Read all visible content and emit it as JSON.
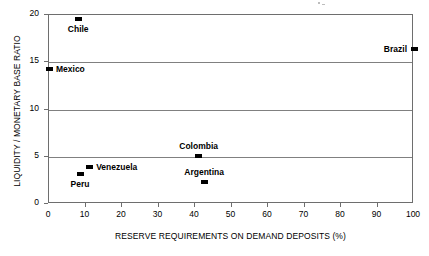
{
  "chart_data": {
    "type": "scatter",
    "title": "",
    "xlabel": "RESERVE REQUIREMENTS ON DEMAND DEPOSITS (%)",
    "ylabel": "LIQUIDITY / MONETARY BASE RATIO",
    "xlim": [
      0,
      100
    ],
    "ylim": [
      0,
      20
    ],
    "xticks": [
      0,
      10,
      20,
      30,
      40,
      50,
      60,
      70,
      80,
      90,
      100
    ],
    "yticks": [
      0,
      5,
      10,
      15,
      20
    ],
    "xtick_labels": [
      "0",
      "10",
      "20",
      "30",
      "40",
      "50",
      "60",
      "70",
      "80",
      "90",
      "100"
    ],
    "ytick_labels": [
      "0",
      "5",
      "10",
      "15",
      "20"
    ],
    "grid": "horizontal",
    "legend": "none",
    "marker": "filled-rectangle",
    "marker_color": "#000000",
    "points": [
      {
        "name": "Chile",
        "x": 8,
        "y": 19.6,
        "label_pos": "below"
      },
      {
        "name": "Mexico",
        "x": 0,
        "y": 14.3,
        "label_pos": "right"
      },
      {
        "name": "Brazil",
        "x": 100,
        "y": 16.4,
        "label_pos": "left"
      },
      {
        "name": "Colombia",
        "x": 41,
        "y": 5.1,
        "label_pos": "above"
      },
      {
        "name": "Venezuela",
        "x": 11,
        "y": 3.9,
        "label_pos": "right"
      },
      {
        "name": "Peru",
        "x": 8.5,
        "y": 3.2,
        "label_pos": "below"
      },
      {
        "name": "Argentina",
        "x": 42.5,
        "y": 2.3,
        "label_pos": "above"
      }
    ]
  }
}
